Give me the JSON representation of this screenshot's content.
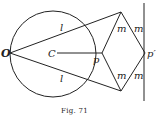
{
  "figure": {
    "caption": "Fig. 71",
    "labels": {
      "O": "O",
      "C": "C",
      "p": "p",
      "p_prime": "p′",
      "l_top": "l",
      "l_bottom": "l",
      "m_top_left": "m",
      "m_top_right": "m",
      "m_bottom_left": "m",
      "m_bottom_right": "m"
    },
    "colors": {
      "stroke": "#222222",
      "background": "#ffffff"
    }
  }
}
